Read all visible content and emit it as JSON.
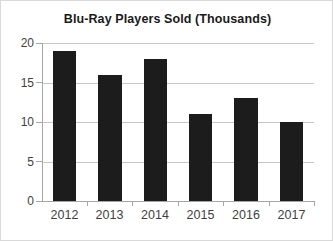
{
  "chart_data": {
    "type": "bar",
    "title": "Blu-Ray Players Sold (Thousands)",
    "xlabel": "",
    "ylabel": "",
    "categories": [
      "2012",
      "2013",
      "2014",
      "2015",
      "2016",
      "2017"
    ],
    "values": [
      19,
      16,
      18,
      11,
      13,
      10
    ],
    "ylim": [
      0,
      20
    ],
    "yticks": [
      0,
      5,
      10,
      15,
      20
    ],
    "ytick_labels": [
      "0",
      "5",
      "10",
      "15",
      "20"
    ],
    "grid": true,
    "legend": false,
    "series_color": "#1c1c1c",
    "gridline_color": "#c8c8c8",
    "axis_color": "#a6a6a6",
    "background": "#ffffff",
    "border_color": "#d9d9d9"
  }
}
